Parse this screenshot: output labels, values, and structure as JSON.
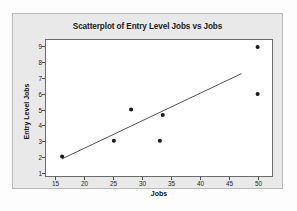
{
  "chart_data": {
    "type": "scatter",
    "title": "Scatterplot of Entry Level Jobs vs Jobs",
    "xlabel": "Jobs",
    "ylabel": "Entry Level Jobs",
    "xlim": [
      13.2,
      52.5
    ],
    "ylim": [
      0.75,
      9.45
    ],
    "xticks": [
      15,
      20,
      25,
      30,
      35,
      40,
      45,
      50
    ],
    "yticks": [
      1,
      2,
      3,
      4,
      5,
      6,
      7,
      8,
      9
    ],
    "xtick_labels": [
      "15",
      "20",
      "25",
      "30",
      "35",
      "40",
      "45",
      "50"
    ],
    "ytick_labels": [
      "1",
      "2",
      "3",
      "4",
      "5",
      "6",
      "7",
      "8",
      "9"
    ],
    "grid": false,
    "legend": "none",
    "marker": {
      "shape": "circle",
      "color": "#1a1a1a",
      "size": 3.2
    },
    "points": [
      {
        "x": 16.0,
        "y": 2.0
      },
      {
        "x": 25.0,
        "y": 3.0
      },
      {
        "x": 28.0,
        "y": 5.0
      },
      {
        "x": 33.0,
        "y": 3.0
      },
      {
        "x": 33.5,
        "y": 4.65
      },
      {
        "x": 50.0,
        "y": 9.0
      },
      {
        "x": 50.0,
        "y": 6.0
      }
    ],
    "fit_line": {
      "type": "regression",
      "color": "#3a3a3a",
      "x_start": 16.0,
      "y_start": 1.85,
      "x_end": 47.2,
      "y_end": 7.3
    },
    "colors": {
      "panel_background": "#e9e9e9",
      "plot_background": "#ffffff",
      "axis": "#6b6b6b",
      "text": "#1a1a1a"
    }
  }
}
